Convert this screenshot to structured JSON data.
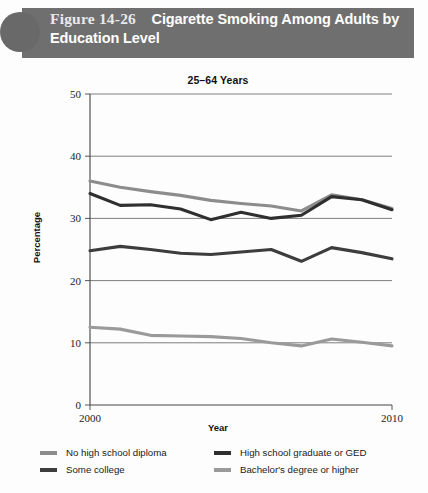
{
  "header": {
    "figure_number": "Figure 14-26",
    "figure_title": "Cigarette Smoking Among Adults by Education Level",
    "band_color": "#706f6f",
    "circle_color": "#6a6969"
  },
  "chart_data": {
    "type": "line",
    "title": "25–64 Years",
    "xlabel": "Year",
    "ylabel": "Percentage",
    "x": [
      2000,
      2001,
      2002,
      2003,
      2004,
      2005,
      2006,
      2007,
      2008,
      2009,
      2010
    ],
    "xtick_labels": [
      "2000",
      "2010"
    ],
    "xtick_values": [
      2000,
      2010
    ],
    "xlim": [
      2000,
      2010
    ],
    "ylim": [
      0,
      50
    ],
    "ytick_labels": [
      "0",
      "10",
      "20",
      "30",
      "40",
      "50"
    ],
    "ytick_values": [
      0,
      10,
      20,
      30,
      40,
      50
    ],
    "grid": "horizontal",
    "legend_position": "below",
    "series": [
      {
        "name": "No high school diploma",
        "color": "#8c8c8c",
        "values": [
          36.0,
          35.0,
          34.3,
          33.7,
          32.9,
          32.4,
          32.0,
          31.2,
          33.8,
          33.0,
          31.6
        ]
      },
      {
        "name": "High school graduate or GED",
        "color": "#2f2f2f",
        "values": [
          34.0,
          32.1,
          32.2,
          31.5,
          29.8,
          31.0,
          30.0,
          30.5,
          33.5,
          33.0,
          31.4
        ]
      },
      {
        "name": "Some college",
        "color": "#3d3d3d",
        "values": [
          24.8,
          25.5,
          25.0,
          24.4,
          24.2,
          24.6,
          25.0,
          23.1,
          25.3,
          24.5,
          23.5
        ]
      },
      {
        "name": "Bachelor's degree or higher",
        "color": "#9a9a9a",
        "values": [
          12.5,
          12.2,
          11.2,
          11.1,
          11.0,
          10.7,
          10.0,
          9.5,
          10.6,
          10.1,
          9.5
        ]
      }
    ]
  },
  "legend": {
    "items": [
      {
        "label": "No high school diploma",
        "color": "#8c8c8c"
      },
      {
        "label": "Some college",
        "color": "#3d3d3d"
      },
      {
        "label": "High school graduate or GED",
        "color": "#2f2f2f"
      },
      {
        "label": "Bachelor's degree or higher",
        "color": "#9a9a9a"
      }
    ]
  }
}
